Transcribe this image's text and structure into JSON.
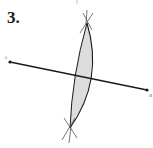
{
  "problem": {
    "number": "3."
  },
  "diagram": {
    "type": "perpendicular-bisector-construction",
    "points": [
      {
        "label": "A",
        "x": 10,
        "y": 62
      },
      {
        "label": "B",
        "x": 147,
        "y": 90
      }
    ],
    "arc_intersections": [
      {
        "x": 87,
        "y": 23
      },
      {
        "x": 70,
        "y": 128
      }
    ],
    "lens_fill": "#dcdcdc",
    "stroke": "#1a1a1a"
  }
}
